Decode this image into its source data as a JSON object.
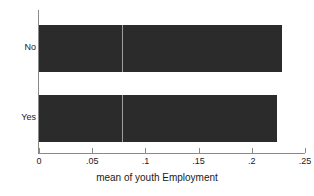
{
  "chart_data": {
    "type": "bar",
    "orientation": "horizontal",
    "title": "",
    "xlabel": "mean of youth Employment",
    "ylabel": "",
    "categories": [
      "No",
      "Yes"
    ],
    "values": [
      0.228,
      0.224
    ],
    "xlim": [
      0,
      0.25
    ],
    "xticks": [
      0,
      0.05,
      0.1,
      0.15,
      0.2,
      0.25
    ],
    "xtick_labels": [
      "0",
      ".05",
      ".1",
      ".15",
      ".2",
      ".25"
    ],
    "grid": false,
    "legend": "none",
    "bar_color": "#2b2b2b",
    "reference_line": {
      "value": 0.078,
      "color": "#ffffff",
      "orientation": "vertical"
    },
    "annotations": []
  }
}
